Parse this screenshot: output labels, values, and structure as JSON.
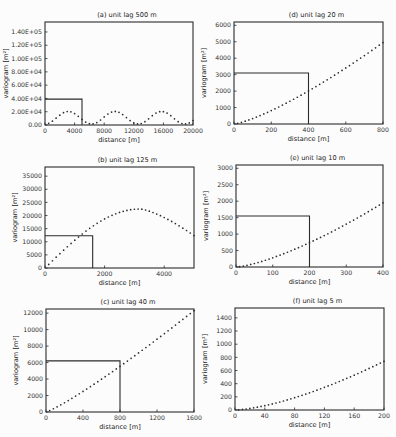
{
  "chart_data": [
    {
      "id": "a",
      "type": "scatter",
      "title": "(a) unit lag 500 m",
      "xlabel": "distance [m]",
      "ylabel": "variogram [m²]",
      "xlim": [
        0,
        20000
      ],
      "ylim": [
        0,
        155000
      ],
      "xticks": [
        0,
        4000,
        8000,
        12000,
        16000,
        20000
      ],
      "xtick_labels": [
        "0",
        "4000",
        "8000",
        "12000",
        "16000",
        "20000"
      ],
      "yticks": [
        0,
        20000,
        40000,
        60000,
        80000,
        100000,
        120000,
        140000
      ],
      "ytick_labels": [
        "0.00",
        "2.00E+04",
        "4.00E+04",
        "6.00E+04",
        "8.00E+04",
        "1.00E+05",
        "1.20E+05",
        "1.40E+05"
      ],
      "box": {
        "x": 5000,
        "y": 39000
      },
      "curve": "periodic",
      "period": 6300,
      "amplitude": 21000,
      "n": 40,
      "frame": {
        "x": 45,
        "y": 22,
        "w": 148,
        "h": 103
      }
    },
    {
      "id": "b",
      "type": "scatter",
      "title": "(b) unit lag 125 m",
      "xlabel": "distance [m]",
      "ylabel": "variogram [m²]",
      "xlim": [
        0,
        5000
      ],
      "ylim": [
        0,
        38500
      ],
      "xticks": [
        0,
        2000,
        4000
      ],
      "xtick_labels": [
        "0",
        "2000",
        "4000"
      ],
      "yticks": [
        0,
        5000,
        10000,
        15000,
        20000,
        25000,
        30000,
        35000
      ],
      "ytick_labels": [
        "0",
        "5000",
        "10000",
        "15000",
        "20000",
        "25000",
        "30000",
        "35000"
      ],
      "box": {
        "x": 1600,
        "y": 12300
      },
      "curve": "hole",
      "peak": 22500,
      "peak_x": 3200,
      "n": 40,
      "frame": {
        "x": 45,
        "y": 167,
        "w": 149,
        "h": 101
      }
    },
    {
      "id": "c",
      "type": "scatter",
      "title": "(c) unit lag 40 m",
      "xlabel": "distance [m]",
      "ylabel": "variogram [m²]",
      "xlim": [
        0,
        1600
      ],
      "ylim": [
        0,
        12500
      ],
      "xticks": [
        0,
        400,
        800,
        1200,
        1600
      ],
      "xtick_labels": [
        "0",
        "400",
        "800",
        "1200",
        "1600"
      ],
      "yticks": [
        0,
        2000,
        4000,
        6000,
        8000,
        10000,
        12000
      ],
      "ytick_labels": [
        "0",
        "2000",
        "4000",
        "6000",
        "8000",
        "10000",
        "12000"
      ],
      "box": {
        "x": 800,
        "y": 6200
      },
      "curve": "power",
      "end_y": 12300,
      "exponent": 1.15,
      "n": 40,
      "frame": {
        "x": 46,
        "y": 309,
        "w": 148,
        "h": 103
      }
    },
    {
      "id": "d",
      "type": "scatter",
      "title": "(d) unit lag 20 m",
      "xlabel": "distance [m]",
      "ylabel": "variogram [m²]",
      "xlim": [
        0,
        800
      ],
      "ylim": [
        0,
        6200
      ],
      "xticks": [
        0,
        200,
        400,
        600,
        800
      ],
      "xtick_labels": [
        "0",
        "200",
        "400",
        "600",
        "800"
      ],
      "yticks": [
        0,
        1000,
        2000,
        3000,
        4000,
        5000,
        6000
      ],
      "ytick_labels": [
        "0",
        "1000",
        "2000",
        "3000",
        "4000",
        "5000",
        "6000"
      ],
      "box": {
        "x": 400,
        "y": 3100
      },
      "curve": "power",
      "end_y": 4950,
      "exponent": 1.3,
      "n": 40,
      "frame": {
        "x": 234,
        "y": 22,
        "w": 149,
        "h": 102
      }
    },
    {
      "id": "e",
      "type": "scatter",
      "title": "(e) unit lag 10 m",
      "xlabel": "distance [m]",
      "ylabel": "variogram [m²]",
      "xlim": [
        0,
        400
      ],
      "ylim": [
        0,
        3100
      ],
      "xticks": [
        0,
        100,
        200,
        300,
        400
      ],
      "xtick_labels": [
        "0",
        "100",
        "200",
        "300",
        "400"
      ],
      "yticks": [
        0,
        500,
        1000,
        1500,
        2000,
        2500,
        3000
      ],
      "ytick_labels": [
        "0",
        "500",
        "1000",
        "1500",
        "2000",
        "2500",
        "3000"
      ],
      "box": {
        "x": 200,
        "y": 1550
      },
      "curve": "power",
      "end_y": 1950,
      "exponent": 1.4,
      "n": 40,
      "frame": {
        "x": 236,
        "y": 165,
        "w": 147,
        "h": 102
      }
    },
    {
      "id": "f",
      "type": "scatter",
      "title": "(f) unit lag 5 m",
      "xlabel": "distance [m]",
      "ylabel": "variogram [m²]",
      "xlim": [
        0,
        200
      ],
      "ylim": [
        0,
        1550
      ],
      "xticks": [
        0,
        40,
        80,
        120,
        160,
        200
      ],
      "xtick_labels": [
        "0",
        "40",
        "80",
        "120",
        "160",
        "200"
      ],
      "yticks": [
        0,
        200,
        400,
        600,
        800,
        1000,
        1200,
        1400
      ],
      "ytick_labels": [
        "0",
        "200",
        "400",
        "600",
        "800",
        "1000",
        "1200",
        "1400"
      ],
      "box": null,
      "curve": "power",
      "end_y": 740,
      "exponent": 1.5,
      "n": 40,
      "frame": {
        "x": 235,
        "y": 308,
        "w": 149,
        "h": 102
      }
    }
  ]
}
